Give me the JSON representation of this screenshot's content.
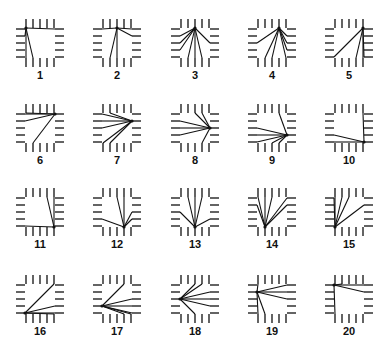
{
  "figure": {
    "line_color": "#111111",
    "pin_color": "#222222",
    "background": "#ffffff"
  },
  "layout": {
    "columns": 5,
    "rows": 4,
    "col_centers": [
      40,
      117,
      195,
      272,
      349
    ],
    "row_centers": [
      43,
      128,
      212,
      299
    ]
  },
  "panels": [
    {
      "label": "1",
      "hub": [
        "T",
        0
      ],
      "targets": [
        [
          "L",
          0
        ],
        [
          "L",
          1
        ],
        [
          "R",
          0
        ],
        [
          "B",
          0
        ],
        [
          "B",
          1
        ]
      ]
    },
    {
      "label": "2",
      "hub": [
        "T",
        2
      ],
      "targets": [
        [
          "L",
          0
        ],
        [
          "R",
          0
        ],
        [
          "R",
          1
        ],
        [
          "B",
          1
        ],
        [
          "B",
          2
        ]
      ]
    },
    {
      "label": "3",
      "hub": [
        "T",
        2
      ],
      "targets": [
        [
          "L",
          1
        ],
        [
          "L",
          2
        ],
        [
          "L",
          3
        ],
        [
          "R",
          2
        ],
        [
          "B",
          1
        ],
        [
          "B",
          2
        ],
        [
          "B",
          3
        ]
      ]
    },
    {
      "label": "4",
      "hub": [
        "T",
        3
      ],
      "targets": [
        [
          "L",
          2
        ],
        [
          "R",
          1
        ],
        [
          "R",
          2
        ],
        [
          "R",
          3
        ],
        [
          "B",
          1
        ],
        [
          "B",
          2
        ],
        [
          "B",
          4
        ]
      ]
    },
    {
      "label": "5",
      "hub": [
        "T",
        4
      ],
      "targets": [
        [
          "L",
          4
        ],
        [
          "R",
          4
        ],
        [
          "B",
          4
        ],
        [
          "B",
          3
        ]
      ]
    },
    {
      "label": "6",
      "hub": [
        "R",
        0
      ],
      "targets": [
        [
          "T",
          0
        ],
        [
          "L",
          0
        ],
        [
          "L",
          1
        ],
        [
          "B",
          1
        ]
      ]
    },
    {
      "label": "7",
      "hub": [
        "R",
        1
      ],
      "targets": [
        [
          "T",
          1
        ],
        [
          "L",
          0
        ],
        [
          "L",
          1
        ],
        [
          "L",
          2
        ],
        [
          "B",
          0
        ],
        [
          "B",
          1
        ]
      ]
    },
    {
      "label": "8",
      "hub": [
        "R",
        2
      ],
      "targets": [
        [
          "T",
          2
        ],
        [
          "T",
          3
        ],
        [
          "L",
          1
        ],
        [
          "L",
          2
        ],
        [
          "L",
          3
        ],
        [
          "B",
          3
        ]
      ]
    },
    {
      "label": "9",
      "hub": [
        "R",
        3
      ],
      "targets": [
        [
          "T",
          3
        ],
        [
          "L",
          2
        ],
        [
          "L",
          3
        ],
        [
          "L",
          4
        ],
        [
          "B",
          2
        ],
        [
          "B",
          3
        ]
      ]
    },
    {
      "label": "10",
      "hub": [
        "R",
        4
      ],
      "targets": [
        [
          "T",
          4
        ],
        [
          "L",
          3
        ],
        [
          "L",
          4
        ],
        [
          "B",
          4
        ]
      ]
    },
    {
      "label": "11",
      "hub": [
        "B",
        4
      ],
      "targets": [
        [
          "T",
          3
        ],
        [
          "T",
          4
        ],
        [
          "L",
          4
        ],
        [
          "R",
          4
        ]
      ]
    },
    {
      "label": "12",
      "hub": [
        "B",
        3
      ],
      "targets": [
        [
          "T",
          2
        ],
        [
          "T",
          3
        ],
        [
          "L",
          3
        ],
        [
          "R",
          2
        ],
        [
          "R",
          3
        ]
      ]
    },
    {
      "label": "13",
      "hub": [
        "B",
        2
      ],
      "targets": [
        [
          "T",
          1
        ],
        [
          "T",
          2
        ],
        [
          "T",
          3
        ],
        [
          "L",
          2
        ],
        [
          "R",
          3
        ]
      ]
    },
    {
      "label": "14",
      "hub": [
        "B",
        1
      ],
      "targets": [
        [
          "T",
          0
        ],
        [
          "T",
          1
        ],
        [
          "T",
          2
        ],
        [
          "L",
          1
        ],
        [
          "R",
          0
        ],
        [
          "R",
          1
        ]
      ]
    },
    {
      "label": "15",
      "hub": [
        "B",
        0
      ],
      "targets": [
        [
          "T",
          0
        ],
        [
          "T",
          1
        ],
        [
          "T",
          2
        ],
        [
          "L",
          0
        ],
        [
          "R",
          1
        ]
      ]
    },
    {
      "label": "16",
      "hub": [
        "L",
        4
      ],
      "targets": [
        [
          "T",
          4
        ],
        [
          "R",
          3
        ],
        [
          "R",
          4
        ],
        [
          "B",
          4
        ]
      ]
    },
    {
      "label": "17",
      "hub": [
        "L",
        3
      ],
      "targets": [
        [
          "T",
          3
        ],
        [
          "R",
          2
        ],
        [
          "R",
          3
        ],
        [
          "R",
          4
        ],
        [
          "B",
          3
        ],
        [
          "B",
          4
        ]
      ]
    },
    {
      "label": "18",
      "hub": [
        "L",
        2
      ],
      "targets": [
        [
          "T",
          2
        ],
        [
          "T",
          3
        ],
        [
          "R",
          1
        ],
        [
          "R",
          2
        ],
        [
          "R",
          3
        ],
        [
          "B",
          2
        ]
      ]
    },
    {
      "label": "19",
      "hub": [
        "L",
        1
      ],
      "targets": [
        [
          "T",
          0
        ],
        [
          "R",
          0
        ],
        [
          "R",
          1
        ],
        [
          "R",
          2
        ],
        [
          "B",
          0
        ],
        [
          "B",
          1
        ]
      ]
    },
    {
      "label": "20",
      "hub": [
        "L",
        0
      ],
      "targets": [
        [
          "T",
          0
        ],
        [
          "T",
          1
        ],
        [
          "R",
          0
        ],
        [
          "R",
          1
        ],
        [
          "B",
          0
        ]
      ]
    }
  ]
}
